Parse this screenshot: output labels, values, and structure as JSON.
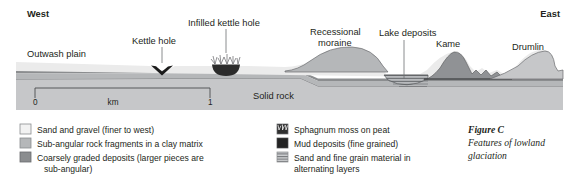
{
  "figure": {
    "caption_title": "Figure C",
    "caption_line1": "Features of lowland",
    "caption_line2": "glaciation"
  },
  "compass": {
    "west": "West",
    "east": "East"
  },
  "diagram_labels": {
    "outwash_plain": "Outwash plain",
    "kettle_hole": "Kettle hole",
    "infilled_kettle_hole": "Infilled kettle hole",
    "recessional_moraine_line1": "Recessional",
    "recessional_moraine_line2": "moraine",
    "lake_deposits": "Lake deposits",
    "kame": "Kame",
    "drumlin": "Drumlin",
    "solid_rock": "Solid rock"
  },
  "scale_bar": {
    "start_label": "0",
    "unit_label": "km",
    "end_label": "1"
  },
  "legend": {
    "left_column": [
      {
        "swatch": "sand-and-gravel-swatch",
        "line1": "Sand and gravel (finer to west)",
        "line2": ""
      },
      {
        "swatch": "sub-angular-rock-fragments-swatch",
        "line1": "Sub-angular rock fragments in a clay matrix",
        "line2": ""
      },
      {
        "swatch": "coarsely-graded-deposits-swatch",
        "line1": "Coarsely graded deposits (larger pieces are",
        "line2": "sub-angular)"
      }
    ],
    "right_column": [
      {
        "swatch": "sphagnum-moss-on-peat-swatch",
        "line1": "Sphagnum moss on peat",
        "line2": ""
      },
      {
        "swatch": "mud-deposits-swatch",
        "line1": "Mud deposits (fine grained)",
        "line2": ""
      },
      {
        "swatch": "sand-and-fine-grain-swatch",
        "line1": "Sand and fine grain material in",
        "line2": "alternating layers"
      }
    ]
  },
  "colors": {
    "sand_gravel": "#ebebeb",
    "sub_angular_clay": "#b5b7b9",
    "coarsely_graded": "#8b8d8f",
    "mud_dark": "#2b2b2b",
    "solid_rock_body": "#c6c7c9",
    "solid_rock_band": "#a2a4a6",
    "kame_dark": "#909295",
    "outline_stroke": "#58595b",
    "text": "#231f20"
  }
}
